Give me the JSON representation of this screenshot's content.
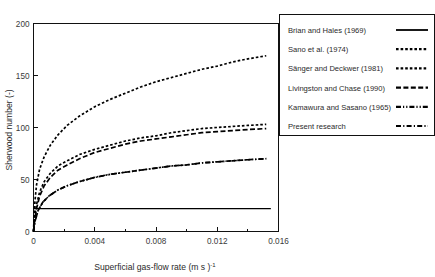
{
  "chart_data": {
    "type": "line",
    "title": "",
    "xlabel": "Superficial gas-flow rate (m s )",
    "xlabel_exponent": "-1",
    "ylabel": "Sherwood number (-)",
    "xlim": [
      0,
      0.016
    ],
    "ylim": [
      0,
      200
    ],
    "xticks": [
      0,
      0.004,
      0.008,
      0.012,
      0.016
    ],
    "xticklabels": [
      "0",
      "0.004",
      "0.008",
      "0.012",
      "0.016"
    ],
    "xminorticks": [
      0.002,
      0.006,
      0.01,
      0.014
    ],
    "yticks": [
      0,
      50,
      100,
      150,
      200
    ],
    "yticklabels": [
      "0",
      "50",
      "100",
      "150",
      "200"
    ],
    "grid": false,
    "legend_position": "right-outside",
    "series": [
      {
        "name": "Brian and Hales (1969)",
        "dash": "none",
        "width": 1.3,
        "x": [
          0,
          0.0002,
          0.0005,
          0.001,
          0.002,
          0.004,
          0.006,
          0.008,
          0.01,
          0.012,
          0.014,
          0.0155
        ],
        "values": [
          22,
          22,
          22,
          22,
          22,
          22,
          22,
          22,
          22,
          22,
          22,
          22
        ]
      },
      {
        "name": "Sano et al. (1974)",
        "dash": "2.6 2.0",
        "width": 1.7,
        "x": [
          0,
          5e-05,
          0.0001,
          0.0002,
          0.0004,
          0.0007,
          0.0011,
          0.0016,
          0.0022,
          0.003,
          0.004,
          0.005,
          0.006,
          0.007,
          0.008,
          0.009,
          0.01,
          0.011,
          0.012,
          0.013,
          0.014,
          0.0152
        ],
        "values": [
          0,
          18,
          30,
          45,
          60,
          72,
          83,
          93,
          102,
          111,
          120,
          127,
          133,
          139,
          144,
          148,
          152,
          156,
          159,
          163,
          166,
          169
        ]
      },
      {
        "name": "Sänger and Deckwer (1981)",
        "dash": "2.6 2.0",
        "width": 1.7,
        "x": [
          0,
          8e-05,
          0.0002,
          0.0004,
          0.0007,
          0.0011,
          0.0016,
          0.0022,
          0.003,
          0.004,
          0.005,
          0.006,
          0.007,
          0.008,
          0.009,
          0.01,
          0.011,
          0.012,
          0.013,
          0.014,
          0.0152
        ],
        "values": [
          0,
          14,
          26,
          38,
          48,
          56,
          63,
          68,
          74,
          79,
          83,
          87,
          90,
          92,
          95,
          97,
          99,
          100,
          101,
          102,
          103
        ]
      },
      {
        "name": "Livingston and Chase (1990)",
        "dash": "5.0 2.4",
        "width": 1.7,
        "x": [
          0,
          8e-05,
          0.0002,
          0.0004,
          0.0007,
          0.0011,
          0.0016,
          0.0022,
          0.003,
          0.004,
          0.005,
          0.006,
          0.007,
          0.008,
          0.009,
          0.01,
          0.011,
          0.012,
          0.013,
          0.014,
          0.0152
        ],
        "values": [
          0,
          12,
          22,
          34,
          44,
          52,
          59,
          64,
          70,
          76,
          80,
          84,
          87,
          89,
          91,
          93,
          95,
          96,
          97,
          98,
          99
        ]
      },
      {
        "name": "Kamawura and Sasano (1965)",
        "dash": "5.0 2.0 1.2 2.0 1.2 2.0",
        "width": 1.7,
        "x": [
          0,
          0.0001,
          0.0003,
          0.0006,
          0.001,
          0.0016,
          0.0022,
          0.003,
          0.004,
          0.005,
          0.006,
          0.007,
          0.008,
          0.009,
          0.01,
          0.011,
          0.012,
          0.013,
          0.014,
          0.0152
        ],
        "values": [
          0,
          10,
          20,
          28,
          34,
          40,
          44,
          48,
          52,
          55,
          57,
          59,
          61,
          63,
          64,
          66,
          67,
          68,
          69,
          70
        ]
      },
      {
        "name": "Present research",
        "dash": "5.0 2.2 1.2 2.2",
        "width": 1.7,
        "x": [
          0,
          0.0001,
          0.0003,
          0.0006,
          0.001,
          0.0016,
          0.0022,
          0.003,
          0.004,
          0.005,
          0.006,
          0.007,
          0.008,
          0.009,
          0.01,
          0.011,
          0.012,
          0.013,
          0.014,
          0.0152
        ],
        "values": [
          0,
          10,
          20,
          28,
          34,
          40,
          44,
          48,
          52,
          55,
          57,
          59,
          61,
          63,
          64,
          66,
          67,
          68,
          69,
          70
        ]
      }
    ]
  },
  "legend": {
    "entries": [
      {
        "label": "Brian and Hales (1969)"
      },
      {
        "label": "Sano et al. (1974)"
      },
      {
        "label": "Sänger and Deckwer (1981)"
      },
      {
        "label": "Livingston and Chase (1990)"
      },
      {
        "label": "Kamawura and Sasano (1965)"
      },
      {
        "label": "Present research"
      }
    ]
  },
  "colors": {
    "ink": "#000000",
    "axis": "#111111",
    "text": "#2a2a2a",
    "background": "#ffffff"
  }
}
